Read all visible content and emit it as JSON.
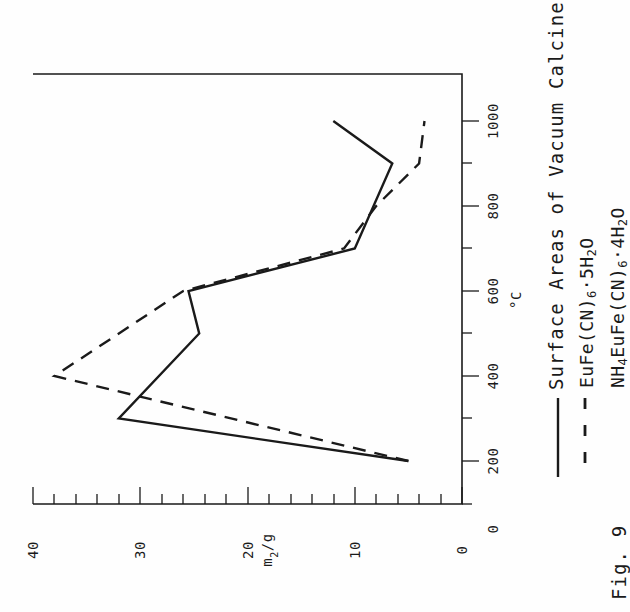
{
  "figure": {
    "number_label": "Fig. 9",
    "title": "Surface Areas of Vacuum Calcines"
  },
  "legend": {
    "position": "right-of-plot",
    "entries": [
      {
        "key": "solid",
        "sample": "solid-line",
        "label": "EuFe(CN)6·5H2O"
      },
      {
        "key": "dashed",
        "sample": "dashed-line",
        "label": "NH4EuFe(CN)6·4H2O"
      }
    ]
  },
  "colors": {
    "ink": "#1a1a1a",
    "paper": "#fefefe"
  },
  "axes": {
    "value_axis": {
      "title": "m2/g",
      "title_display": "m²/g",
      "ticks": [
        "40",
        "30",
        "20",
        "10",
        "0"
      ],
      "range": [
        0,
        40
      ],
      "minor_tick_step": 2
    },
    "temp_axis": {
      "title": "°C",
      "ticks": [
        "0",
        "200",
        "400",
        "600",
        "800",
        "1000"
      ],
      "range": [
        0,
        1080
      ],
      "minor_tick_step": 100
    }
  },
  "chart_data": {
    "type": "line",
    "title": "Surface Areas of Vacuum Calcines",
    "xlabel": "°C",
    "ylabel": "m²/g",
    "xlim": [
      0,
      1080
    ],
    "ylim": [
      0,
      40
    ],
    "grid": false,
    "orientation": "rotated-90-ccw",
    "legend": "right",
    "series": [
      {
        "name": "EuFe(CN)6·5H2O",
        "style": "solid",
        "x": [
          200,
          300,
          500,
          600,
          700,
          900,
          1000
        ],
        "y": [
          5.0,
          32.0,
          24.5,
          25.5,
          10.0,
          6.5,
          12.0
        ]
      },
      {
        "name": "NH4EuFe(CN)6·4H2O",
        "style": "dashed",
        "x": [
          200,
          400,
          600,
          700,
          800,
          900,
          1000
        ],
        "y": [
          5.0,
          38.0,
          26.0,
          11.0,
          8.0,
          4.0,
          3.5
        ]
      }
    ]
  }
}
